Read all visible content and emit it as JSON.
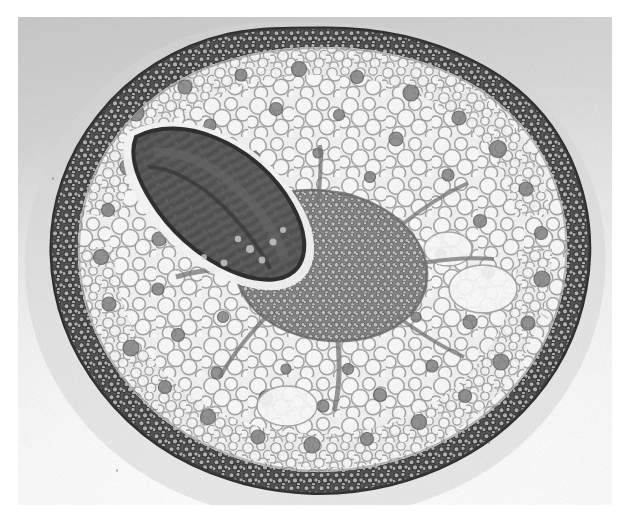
{
  "image": {
    "kind": "light-micrograph",
    "subject": "plant stem transverse section",
    "caption": "",
    "colorspace": "grayscale",
    "print_margin_color": "#ffffff",
    "field_background_color": "#e8e8e8",
    "vignette_dark_corner": "#c9c9c9"
  },
  "frame": {
    "page_width": 630,
    "page_height": 531,
    "photo_left": 18,
    "photo_top": 17,
    "photo_width": 594,
    "photo_height": 488
  },
  "specimen": {
    "outline_name": "stem-outline",
    "center_x": 304,
    "center_y": 243,
    "radius_x": 258,
    "radius_y": 232,
    "palette": {
      "epidermis": "#4a4a4a",
      "collenchyma": "#5d5d5d",
      "cortex_parenchyma": "#efefef",
      "cell_wall": "#8e8e8e",
      "idioblast": "#7a7a7a",
      "vascular_dense": "#6a6a6a",
      "bud_dark": "#3b3b3b",
      "pith": "#f2f2f2"
    },
    "regions": [
      {
        "name": "epidermis-ring",
        "label": "epidermis"
      },
      {
        "name": "collenchyma-band",
        "label": "collenchyma / sclerenchyma band"
      },
      {
        "name": "cortex",
        "label": "cortical parenchyma"
      },
      {
        "name": "vascular-region",
        "label": "procambial / vascular tissue"
      },
      {
        "name": "axillary-bud",
        "label": "axillary bud primordium"
      },
      {
        "name": "pith",
        "label": "pith parenchyma"
      }
    ]
  },
  "artifacts": {
    "dust_specks": 14,
    "scratches": 3
  }
}
